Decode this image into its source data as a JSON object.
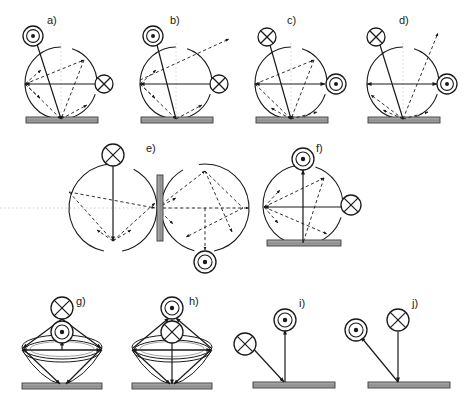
{
  "figure": {
    "kind": "scientific-diagram",
    "width": 467,
    "height": 408,
    "colors": {
      "stroke": "#1a1a1a",
      "plate_fill": "#9a9a9a",
      "plate_stroke": "#3a3a3a",
      "dotted_axis": "#c8c8c8",
      "background": "#ffffff"
    }
  },
  "symbols": {
    "out_of_page": {
      "name": "circled-dot-icon",
      "glyph": "dot-in-double-circle",
      "meaning": "vector out of page"
    },
    "into_page": {
      "name": "circled-x-icon",
      "glyph": "x-in-circle",
      "meaning": "vector into page"
    }
  },
  "panels": [
    {
      "id": "a",
      "label": "a)",
      "label_x": 47,
      "label_y": 24,
      "type": "circle-on-plate",
      "cx": 61,
      "cy": 83,
      "r": 36,
      "plate": {
        "x": 26,
        "y": 117,
        "w": 72,
        "h": 6
      },
      "top_symbol": {
        "type": "out_of_page",
        "cx": 33,
        "cy": 36,
        "r": 10
      },
      "side_symbol": {
        "type": "into_page",
        "cx": 104,
        "cy": 84,
        "r": 9,
        "side": "right"
      },
      "has_exit_arrow": false,
      "has_vertical_guide": true,
      "vectors": [
        {
          "x1": 61,
          "y1": 119,
          "x2": 36,
          "y2": 41,
          "style": "solid",
          "head": "end"
        },
        {
          "x1": 25,
          "y1": 84,
          "x2": 95,
          "y2": 84,
          "style": "solid",
          "head": "start"
        },
        {
          "x1": 25,
          "y1": 84,
          "x2": 84,
          "y2": 60,
          "style": "dashed",
          "head": "end"
        },
        {
          "x1": 25,
          "y1": 84,
          "x2": 41,
          "y2": 70,
          "style": "dashed",
          "head": "end"
        },
        {
          "x1": 25,
          "y1": 84,
          "x2": 40,
          "y2": 98,
          "style": "dashed",
          "head": "end"
        },
        {
          "x1": 84,
          "y1": 60,
          "x2": 61,
          "y2": 119,
          "style": "dashed",
          "head": "end"
        },
        {
          "x1": 61,
          "y1": 119,
          "x2": 87,
          "y2": 105,
          "style": "dashed",
          "head": "end"
        },
        {
          "x1": 25,
          "y1": 84,
          "x2": 61,
          "y2": 119,
          "style": "dashed",
          "head": "end"
        }
      ]
    },
    {
      "id": "b",
      "label": "b)",
      "label_x": 170,
      "label_y": 24,
      "type": "circle-on-plate",
      "cx": 176,
      "cy": 83,
      "r": 36,
      "plate": {
        "x": 141,
        "y": 117,
        "w": 72,
        "h": 6
      },
      "top_symbol": {
        "type": "out_of_page",
        "cx": 153,
        "cy": 36,
        "r": 10
      },
      "side_symbol": {
        "type": "into_page",
        "cx": 219,
        "cy": 84,
        "r": 9,
        "side": "right"
      },
      "has_exit_arrow": true,
      "exit_arrow": {
        "x1": 140,
        "y1": 80,
        "x2": 229,
        "y2": 39
      },
      "has_vertical_guide": true,
      "vectors": [
        {
          "x1": 176,
          "y1": 119,
          "x2": 156,
          "y2": 41,
          "style": "solid",
          "head": "end"
        },
        {
          "x1": 140,
          "y1": 84,
          "x2": 210,
          "y2": 84,
          "style": "solid",
          "head": "start"
        },
        {
          "x1": 140,
          "y1": 84,
          "x2": 156,
          "y2": 70,
          "style": "dashed",
          "head": "end"
        },
        {
          "x1": 140,
          "y1": 84,
          "x2": 155,
          "y2": 98,
          "style": "dashed",
          "head": "end"
        },
        {
          "x1": 140,
          "y1": 84,
          "x2": 176,
          "y2": 119,
          "style": "dashed",
          "head": "end"
        },
        {
          "x1": 176,
          "y1": 119,
          "x2": 202,
          "y2": 105,
          "style": "dashed",
          "head": "end"
        }
      ]
    },
    {
      "id": "c",
      "label": "c)",
      "label_x": 287,
      "label_y": 24,
      "type": "circle-on-plate",
      "cx": 291,
      "cy": 83,
      "r": 36,
      "plate": {
        "x": 256,
        "y": 117,
        "w": 72,
        "h": 6
      },
      "top_symbol": {
        "type": "into_page",
        "cx": 267,
        "cy": 37,
        "r": 9
      },
      "side_symbol": {
        "type": "out_of_page",
        "cx": 336,
        "cy": 84,
        "r": 10,
        "side": "right"
      },
      "has_exit_arrow": false,
      "has_vertical_guide": true,
      "vectors": [
        {
          "x1": 291,
          "y1": 119,
          "x2": 270,
          "y2": 45,
          "style": "solid",
          "head": "none"
        },
        {
          "x1": 255,
          "y1": 84,
          "x2": 325,
          "y2": 84,
          "style": "solid",
          "head": "both"
        },
        {
          "x1": 255,
          "y1": 84,
          "x2": 314,
          "y2": 60,
          "style": "dashed",
          "head": "end"
        },
        {
          "x1": 255,
          "y1": 84,
          "x2": 291,
          "y2": 119,
          "style": "dashed",
          "head": "end"
        },
        {
          "x1": 314,
          "y1": 60,
          "x2": 291,
          "y2": 119,
          "style": "dashed",
          "head": "end"
        },
        {
          "x1": 291,
          "y1": 119,
          "x2": 271,
          "y2": 108,
          "style": "dashed",
          "head": "end"
        },
        {
          "x1": 291,
          "y1": 119,
          "x2": 317,
          "y2": 112,
          "style": "dashed",
          "head": "end"
        }
      ]
    },
    {
      "id": "d",
      "label": "d)",
      "label_x": 399,
      "label_y": 24,
      "type": "circle-on-plate",
      "cx": 403,
      "cy": 83,
      "r": 36,
      "plate": {
        "x": 368,
        "y": 117,
        "w": 72,
        "h": 6
      },
      "top_symbol": {
        "type": "into_page",
        "cx": 376,
        "cy": 37,
        "r": 9
      },
      "side_symbol": {
        "type": "out_of_page",
        "cx": 447,
        "cy": 84,
        "r": 10,
        "side": "right"
      },
      "has_exit_arrow": true,
      "exit_arrow": {
        "x1": 403,
        "y1": 119,
        "x2": 438,
        "y2": 33
      },
      "has_vertical_guide": true,
      "vectors": [
        {
          "x1": 403,
          "y1": 119,
          "x2": 380,
          "y2": 45,
          "style": "solid",
          "head": "none"
        },
        {
          "x1": 367,
          "y1": 84,
          "x2": 437,
          "y2": 84,
          "style": "solid",
          "head": "both"
        },
        {
          "x1": 403,
          "y1": 119,
          "x2": 371,
          "y2": 95,
          "style": "dashed",
          "head": "end"
        },
        {
          "x1": 403,
          "y1": 119,
          "x2": 383,
          "y2": 110,
          "style": "dashed",
          "head": "end"
        },
        {
          "x1": 403,
          "y1": 119,
          "x2": 428,
          "y2": 112,
          "style": "dashed",
          "head": "end"
        }
      ]
    },
    {
      "id": "e",
      "label": "e)",
      "label_x": 146,
      "label_y": 152,
      "type": "double-circle-with-central-plate",
      "left_circle": {
        "cx": 113,
        "cy": 208,
        "r": 44
      },
      "right_circle": {
        "cx": 205,
        "cy": 208,
        "r": 44
      },
      "plate": {
        "x": 157,
        "y": 175,
        "w": 6,
        "h": 66
      },
      "top_symbol": {
        "type": "into_page",
        "cx": 113,
        "cy": 155,
        "r": 11
      },
      "bottom_symbol": {
        "type": "out_of_page",
        "cx": 205,
        "cy": 262,
        "r": 11
      },
      "dotted_axis": {
        "y": 208,
        "x1": 0,
        "x2": 250
      },
      "vectors": [
        {
          "x1": 113,
          "y1": 241,
          "x2": 113,
          "y2": 166,
          "style": "solid",
          "head": "start"
        },
        {
          "x1": 113,
          "y1": 241,
          "x2": 155,
          "y2": 203,
          "style": "dashed",
          "head": "end"
        },
        {
          "x1": 113,
          "y1": 241,
          "x2": 97,
          "y2": 230,
          "style": "dashed",
          "head": "end"
        },
        {
          "x1": 113,
          "y1": 241,
          "x2": 131,
          "y2": 230,
          "style": "dashed",
          "head": "end"
        },
        {
          "x1": 69,
          "y1": 192,
          "x2": 155,
          "y2": 208,
          "style": "dashed",
          "head": "end"
        },
        {
          "x1": 69,
          "y1": 192,
          "x2": 113,
          "y2": 241,
          "style": "dashed",
          "head": "none"
        },
        {
          "x1": 157,
          "y1": 208,
          "x2": 249,
          "y2": 208,
          "style": "dashed",
          "head": "end"
        },
        {
          "x1": 157,
          "y1": 208,
          "x2": 205,
          "y2": 171,
          "style": "dashed",
          "head": "end"
        },
        {
          "x1": 157,
          "y1": 208,
          "x2": 176,
          "y2": 198,
          "style": "dashed",
          "head": "end"
        },
        {
          "x1": 157,
          "y1": 208,
          "x2": 173,
          "y2": 224,
          "style": "dashed",
          "head": "end"
        },
        {
          "x1": 205,
          "y1": 171,
          "x2": 243,
          "y2": 208,
          "style": "dashed",
          "head": "none"
        },
        {
          "x1": 205,
          "y1": 171,
          "x2": 232,
          "y2": 232,
          "style": "dashed",
          "head": "end"
        },
        {
          "x1": 205,
          "y1": 208,
          "x2": 205,
          "y2": 250,
          "style": "dashed",
          "head": "end"
        },
        {
          "x1": 243,
          "y1": 208,
          "x2": 186,
          "y2": 237,
          "style": "dashed",
          "head": "end"
        }
      ]
    },
    {
      "id": "f",
      "label": "f)",
      "label_x": 316,
      "label_y": 152,
      "type": "circle-on-plate",
      "cx": 303,
      "cy": 205,
      "r": 40,
      "plate": {
        "x": 267,
        "y": 240,
        "w": 74,
        "h": 6
      },
      "top_symbol": {
        "type": "out_of_page",
        "cx": 303,
        "cy": 159,
        "r": 11
      },
      "side_symbol": {
        "type": "into_page",
        "cx": 351,
        "cy": 205,
        "r": 10,
        "side": "right"
      },
      "has_exit_arrow": false,
      "has_vertical_guide": false,
      "vectors": [
        {
          "x1": 303,
          "y1": 243,
          "x2": 303,
          "y2": 170,
          "style": "solid",
          "head": "end"
        },
        {
          "x1": 264,
          "y1": 207,
          "x2": 342,
          "y2": 207,
          "style": "solid",
          "head": "start"
        },
        {
          "x1": 264,
          "y1": 207,
          "x2": 324,
          "y2": 178,
          "style": "dashed",
          "head": "end"
        },
        {
          "x1": 264,
          "y1": 207,
          "x2": 280,
          "y2": 190,
          "style": "dashed",
          "head": "end"
        },
        {
          "x1": 264,
          "y1": 207,
          "x2": 278,
          "y2": 223,
          "style": "dashed",
          "head": "end"
        },
        {
          "x1": 324,
          "y1": 178,
          "x2": 303,
          "y2": 243,
          "style": "dashed",
          "head": "none"
        },
        {
          "x1": 264,
          "y1": 207,
          "x2": 327,
          "y2": 234,
          "style": "dashed",
          "head": "end"
        }
      ]
    },
    {
      "id": "g",
      "label": "g)",
      "label_x": 76,
      "label_y": 305,
      "type": "torus-cone",
      "center_x": 62,
      "ring": {
        "cx": 62,
        "cy": 350,
        "rx": 40,
        "ry": 12
      },
      "cone_apex": {
        "x": 62,
        "y": 385
      },
      "plate": {
        "x": 22,
        "y": 383,
        "w": 80,
        "h": 6
      },
      "upper_symbol": {
        "type": "into_page",
        "cx": 62,
        "cy": 308,
        "r": 11
      },
      "lower_symbol": {
        "type": "out_of_page",
        "cx": 62,
        "cy": 332,
        "r": 11
      },
      "vectors": [
        {
          "x1": 62,
          "y1": 350,
          "x2": 62,
          "y2": 341,
          "style": "solid",
          "head": "end"
        },
        {
          "x1": 62,
          "y1": 319,
          "x2": 23,
          "y2": 348,
          "style": "solid",
          "head": "end"
        },
        {
          "x1": 62,
          "y1": 319,
          "x2": 101,
          "y2": 348,
          "style": "solid",
          "head": "end"
        },
        {
          "x1": 22,
          "y1": 348,
          "x2": 60,
          "y2": 384,
          "style": "solid",
          "head": "end"
        },
        {
          "x1": 102,
          "y1": 348,
          "x2": 66,
          "y2": 384,
          "style": "solid",
          "head": "end"
        },
        {
          "x1": 22,
          "y1": 350,
          "x2": 101,
          "y2": 350,
          "style": "solid",
          "head": "both"
        }
      ]
    },
    {
      "id": "h",
      "label": "h)",
      "label_x": 189,
      "label_y": 305,
      "type": "torus-cone",
      "center_x": 172,
      "ring": {
        "cx": 172,
        "cy": 350,
        "rx": 40,
        "ry": 12
      },
      "cone_apex": {
        "x": 172,
        "y": 385
      },
      "plate": {
        "x": 132,
        "y": 383,
        "w": 80,
        "h": 6
      },
      "upper_symbol": {
        "type": "out_of_page",
        "cx": 172,
        "cy": 308,
        "r": 11
      },
      "lower_symbol": {
        "type": "into_page",
        "cx": 172,
        "cy": 332,
        "r": 11
      },
      "vectors": [
        {
          "x1": 172,
          "y1": 341,
          "x2": 172,
          "y2": 320,
          "style": "solid",
          "head": "end"
        },
        {
          "x1": 133,
          "y1": 348,
          "x2": 169,
          "y2": 318,
          "style": "solid",
          "head": "end"
        },
        {
          "x1": 211,
          "y1": 348,
          "x2": 176,
          "y2": 318,
          "style": "solid",
          "head": "end"
        },
        {
          "x1": 172,
          "y1": 341,
          "x2": 172,
          "y2": 384,
          "style": "solid",
          "head": "end"
        },
        {
          "x1": 133,
          "y1": 350,
          "x2": 170,
          "y2": 384,
          "style": "solid",
          "head": "end"
        },
        {
          "x1": 211,
          "y1": 350,
          "x2": 174,
          "y2": 384,
          "style": "solid",
          "head": "end"
        },
        {
          "x1": 132,
          "y1": 350,
          "x2": 211,
          "y2": 350,
          "style": "solid",
          "head": "both"
        }
      ]
    },
    {
      "id": "i",
      "label": "i)",
      "label_x": 299,
      "label_y": 307,
      "type": "plate-scatter",
      "plate": {
        "x": 253,
        "y": 382,
        "w": 82,
        "h": 6
      },
      "impact": {
        "x": 285,
        "y": 382
      },
      "incoming": {
        "x1": 248,
        "y1": 343,
        "x2": 284,
        "y2": 382,
        "head": "end"
      },
      "outgoing": {
        "x1": 285,
        "y1": 382,
        "x2": 285,
        "y2": 330,
        "head": "end"
      },
      "in_symbol": {
        "type": "into_page",
        "cx": 245,
        "cy": 344,
        "r": 11
      },
      "out_symbol": {
        "type": "out_of_page",
        "cx": 285,
        "cy": 320,
        "r": 11
      }
    },
    {
      "id": "j",
      "label": "j)",
      "label_x": 412,
      "label_y": 307,
      "type": "plate-scatter",
      "plate": {
        "x": 368,
        "y": 382,
        "w": 82,
        "h": 6
      },
      "impact": {
        "x": 398,
        "y": 382
      },
      "incoming": {
        "x1": 398,
        "y1": 332,
        "x2": 398,
        "y2": 382,
        "head": "end"
      },
      "outgoing": {
        "x1": 398,
        "y1": 382,
        "x2": 361,
        "y2": 337,
        "head": "end"
      },
      "in_symbol": {
        "type": "into_page",
        "cx": 398,
        "cy": 320,
        "r": 11
      },
      "out_symbol": {
        "type": "out_of_page",
        "cx": 356,
        "cy": 330,
        "r": 11
      }
    }
  ]
}
